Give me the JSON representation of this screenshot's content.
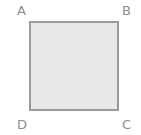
{
  "figure": {
    "background_color": "#ffffff",
    "square": {
      "name": "square-abcd",
      "x": 30,
      "y": 22,
      "side": 88,
      "stroke_color": "#9a9a9a",
      "stroke_width": 2,
      "fill_color": "#ffffff"
    },
    "shaded_region": {
      "name": "shaded-segment",
      "description": "Region of the square bounded by side DC, side CB and the arc",
      "fill_color": "#e9e9e9"
    },
    "arc": {
      "name": "quarter-circle-arc",
      "center_vertex": "D",
      "center_x": 30,
      "center_y": 110,
      "radius": 88,
      "start_point": "D-side-on-AD",
      "end_point": "near-B-on-AB",
      "stroke_color": "#9a9a9a",
      "stroke_width": 2,
      "dash_pattern": "3 4",
      "style": "dashed"
    },
    "vertices": [
      {
        "id": "A",
        "label": "A",
        "position": "top-left",
        "x": 30,
        "y": 22
      },
      {
        "id": "B",
        "label": "B",
        "position": "top-right",
        "x": 118,
        "y": 22
      },
      {
        "id": "C",
        "label": "C",
        "position": "bottom-right",
        "x": 118,
        "y": 110
      },
      {
        "id": "D",
        "label": "D",
        "position": "bottom-left",
        "x": 30,
        "y": 110
      }
    ],
    "label_color": "#8e8e8e"
  }
}
